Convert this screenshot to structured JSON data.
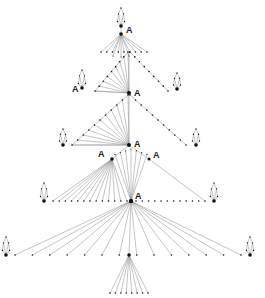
{
  "diagram": {
    "type": "tree-graph",
    "hub_label": "A",
    "colors": {
      "edge": "#8a8a8a",
      "node": "#111111",
      "background": "#ffffff"
    },
    "hubs": [
      {
        "id": "h0",
        "x": 121,
        "y": 27,
        "label": "A"
      },
      {
        "id": "h1",
        "x": 129,
        "y": 93,
        "label": "A"
      },
      {
        "id": "h1L",
        "x": 70,
        "y": 89,
        "label": "A"
      },
      {
        "id": "h2",
        "x": 129,
        "y": 145,
        "label": "A"
      },
      {
        "id": "h3L",
        "x": 112,
        "y": 159,
        "label": "A"
      },
      {
        "id": "h3R",
        "x": 149,
        "y": 159,
        "label": "A"
      },
      {
        "id": "h4",
        "x": 131,
        "y": 201,
        "label": "A"
      }
    ]
  }
}
